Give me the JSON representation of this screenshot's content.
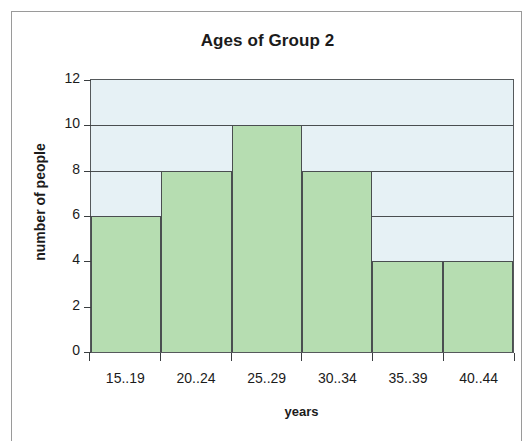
{
  "chart_data": {
    "type": "bar",
    "title": "Ages of Group 2",
    "xlabel": "years",
    "ylabel": "number of people",
    "categories": [
      "15..19",
      "20..24",
      "25..29",
      "30..34",
      "35..39",
      "40..44"
    ],
    "values": [
      6,
      8,
      10,
      8,
      4,
      4
    ],
    "ylim": [
      0,
      12
    ],
    "ytick_labels": [
      "0",
      "2",
      "4",
      "6",
      "8",
      "10",
      "12"
    ],
    "ytick_values": [
      0,
      2,
      4,
      6,
      8,
      10,
      12
    ],
    "gridlines": [
      6,
      8,
      10
    ],
    "grid": true,
    "legend": "none",
    "bar_fill_color": "#b6ddb1",
    "bar_edge_color": "#4a4e50",
    "plot_background_color": "#e6f1f5",
    "axis_color": "#55595b"
  }
}
